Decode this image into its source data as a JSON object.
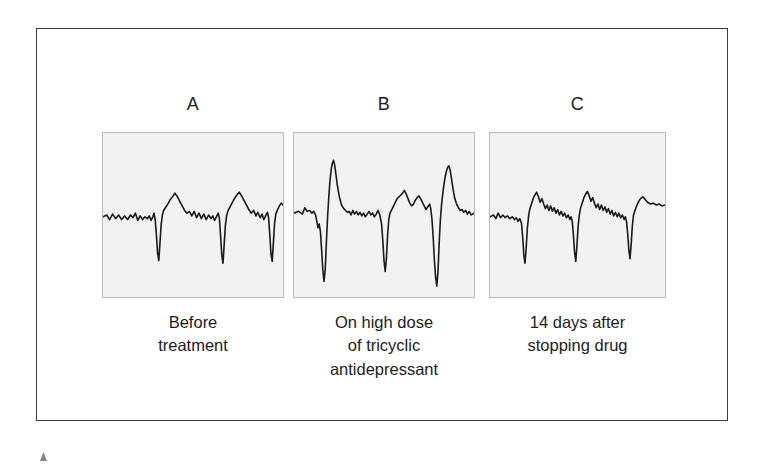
{
  "figure": {
    "panels": [
      {
        "letter": "A",
        "caption_lines": [
          "Before",
          "treatment"
        ],
        "trace_name": "ecg-trace-baseline"
      },
      {
        "letter": "B",
        "caption_lines": [
          "On high dose",
          "of tricyclic",
          "antidepressant"
        ],
        "trace_name": "ecg-trace-toxicity"
      },
      {
        "letter": "C",
        "caption_lines": [
          "14 days after",
          "stopping drug"
        ],
        "trace_name": "ecg-trace-recovery"
      }
    ]
  },
  "chart_data": {
    "type": "line",
    "title": "",
    "xlabel": "",
    "ylabel": "",
    "grid": false,
    "legend_position": "none",
    "panels": [
      {
        "label": "A",
        "caption": "Before treatment",
        "viewbox": [
          0,
          0,
          300,
          180
        ],
        "baseline_y": 92,
        "qrs_count": 3,
        "qrs_morphology": "narrow downward deflection",
        "points": "0,92 6,90 11,95 16,89 21,94 26,90 31,95 36,91 41,95 46,90 50,93 54,88 58,96 62,91 66,95 70,92 74,94 77,91 80,96 83,92 85,88 87,95 89,112 91,132 93,140 95,120 97,100 99,90 101,85 104,82 108,78 112,73 116,70 120,66 124,70 128,75 132,80 136,85 140,88 144,86 148,91 152,86 156,93 160,88 164,94 168,89 172,95 176,90 180,94 183,91 186,96 189,92 192,88 194,94 196,113 198,134 200,143 202,122 204,101 206,91 208,86 211,82 215,77 219,72 223,68 227,65 231,69 235,74 239,79 243,84 247,88 251,85 255,91 258,87 262,93 265,89 268,95 271,91 274,87 276,93 278,112 280,133 282,141 284,120 286,99 288,89 291,84 294,80 297,77 300,79"
      },
      {
        "label": "B",
        "caption": "On high dose of tricyclic antidepressant",
        "viewbox": [
          0,
          0,
          300,
          180
        ],
        "baseline_y": 88,
        "qrs_count": 3,
        "qrs_morphology": "markedly widened QRS with deep S wave and tall R wave",
        "points": "0,88 8,86 14,89 18,82 22,86 26,85 30,88 33,86 36,90 38,97 40,104 42,100 44,108 46,128 48,150 50,163 52,150 54,120 56,92 58,70 60,52 62,40 64,33 66,30 68,36 70,46 72,56 74,64 76,71 78,76 80,80 83,83 86,85 89,87 92,86 95,90 98,85 101,89 104,86 107,90 110,87 113,91 116,88 119,92 122,89 125,86 128,90 131,88 134,92 137,89 140,85 143,90 146,100 148,118 150,140 152,152 154,138 156,112 158,95 160,88 163,84 166,80 169,76 172,72 175,70 178,68 181,66 184,63 187,67 190,72 193,77 196,80 199,78 202,74 205,71 208,69 211,72 214,76 217,80 220,84 223,81 226,78 228,83 230,95 232,115 234,140 236,158 238,168 240,152 242,120 244,95 246,78 248,66 250,56 252,48 254,42 256,38 258,36 260,40 262,48 264,57 266,65 268,72 271,78 274,82 277,85 280,84 283,87 286,85 289,89 292,86 295,90 300,88"
      },
      {
        "label": "C",
        "caption": "14 days after stopping drug",
        "viewbox": [
          0,
          0,
          300,
          180
        ],
        "baseline_y": 92,
        "qrs_count": 3,
        "qrs_morphology": "narrow downward deflection, normalized",
        "points": "0,92 6,90 10,94 14,88 18,93 22,90 26,93 30,91 34,94 38,92 42,95 45,93 48,97 51,94 54,99 56,114 58,134 60,143 62,126 64,105 66,92 68,84 71,78 74,72 77,68 80,65 83,70 86,76 89,72 92,78 95,83 98,79 101,85 104,80 107,86 110,82 113,88 116,84 119,90 122,86 125,91 128,88 131,93 134,90 137,95 139,92 141,97 143,112 145,131 147,141 149,124 151,103 153,91 155,83 158,77 161,71 164,67 167,64 170,69 173,75 176,71 179,77 182,82 185,78 188,84 191,79 194,85 197,81 200,87 203,83 206,89 209,85 212,91 215,87 218,92 221,88 224,93 227,90 230,95 232,92 234,97 236,110 238,128 240,138 242,122 244,102 246,90 249,84 252,79 255,75 258,72 262,70 266,73 270,76 275,78 280,77 285,79 290,78 295,80 300,79"
      }
    ]
  }
}
